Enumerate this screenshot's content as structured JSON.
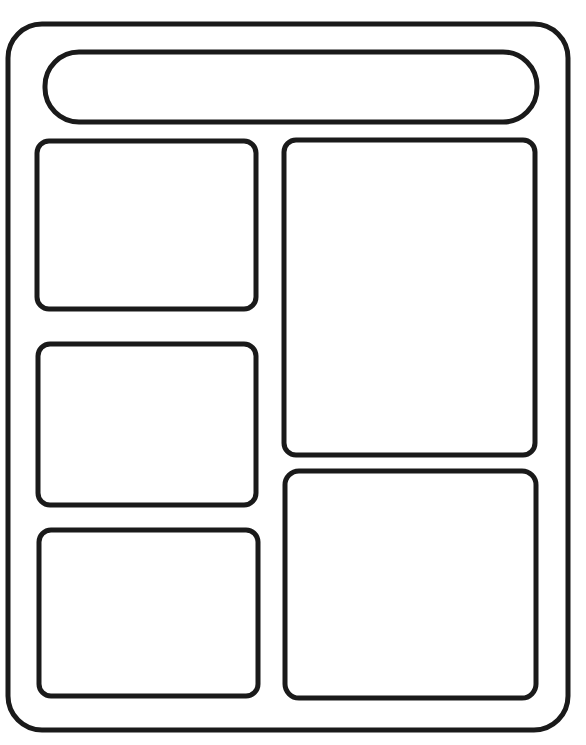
{
  "wireframe": {
    "stroke_color": "#1a1a1a",
    "background_color": "#ffffff",
    "stroke_width": 5,
    "frame": {
      "x": 8,
      "y": 24,
      "w": 560,
      "h": 706,
      "radius": 34
    },
    "header_bar": {
      "x": 45,
      "y": 52,
      "w": 492,
      "h": 70,
      "radius": 34
    },
    "left_column": [
      {
        "id": "left-top",
        "x": 37,
        "y": 141,
        "w": 219,
        "h": 168,
        "radius": 12
      },
      {
        "id": "left-middle",
        "x": 38,
        "y": 344,
        "w": 218,
        "h": 161,
        "radius": 12
      },
      {
        "id": "left-bottom",
        "x": 39,
        "y": 530,
        "w": 219,
        "h": 166,
        "radius": 12
      }
    ],
    "right_column": [
      {
        "id": "right-top",
        "x": 284,
        "y": 140,
        "w": 251,
        "h": 315,
        "radius": 12
      },
      {
        "id": "right-bottom",
        "x": 285,
        "y": 471,
        "w": 251,
        "h": 227,
        "radius": 14
      }
    ]
  }
}
